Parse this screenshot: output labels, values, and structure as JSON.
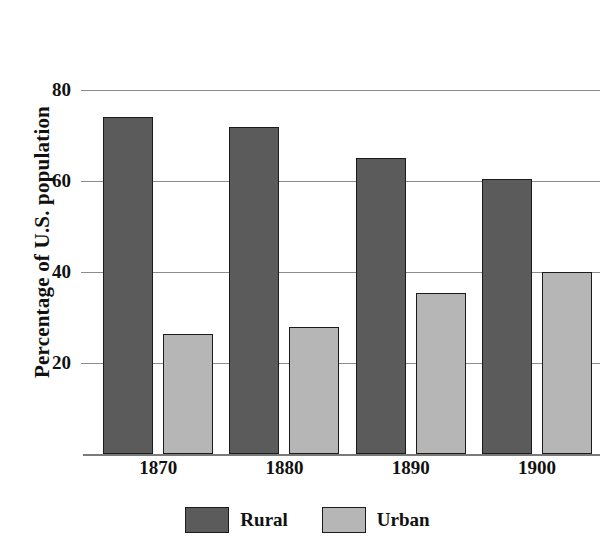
{
  "chart_data": {
    "type": "bar",
    "title": "",
    "subtitle": "",
    "xlabel": "",
    "ylabel": "Percentage of U.S. population",
    "categories": [
      "1870",
      "1880",
      "1890",
      "1900"
    ],
    "series": [
      {
        "name": "Rural",
        "color": "#5b5b5b",
        "values": [
          74,
          72,
          65,
          60.5
        ]
      },
      {
        "name": "Urban",
        "color": "#b6b6b6",
        "values": [
          26.5,
          28,
          35.5,
          40
        ]
      }
    ],
    "ylim": [
      0,
      84
    ],
    "yticks": [
      20,
      40,
      60,
      80
    ],
    "ytick_labels": [
      "20",
      "40",
      "60",
      "80"
    ],
    "grid": "horizontal",
    "legend_position": "bottom",
    "annotations": []
  },
  "axes": {
    "y_title": "Percentage of U.S. population",
    "y_tick_labels": [
      "80",
      "60",
      "40",
      "20"
    ],
    "x_tick_labels": [
      "1870",
      "1880",
      "1890",
      "1900"
    ]
  },
  "legend": {
    "items": [
      {
        "label": "Rural",
        "color": "#5b5b5b"
      },
      {
        "label": "Urban",
        "color": "#b6b6b6"
      }
    ]
  }
}
